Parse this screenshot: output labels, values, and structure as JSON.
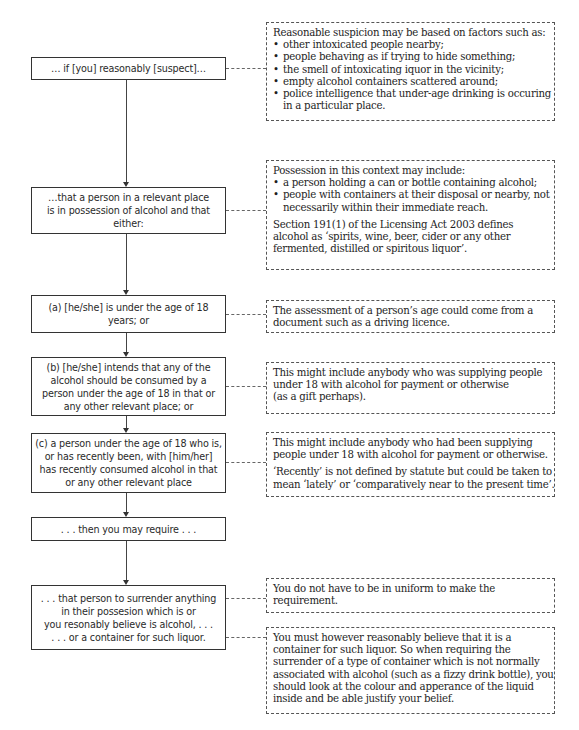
{
  "flowchart": {
    "steps": [
      {
        "lines": [
          "… if [you] reasonably [suspect]…"
        ]
      },
      {
        "lines": [
          "…that a person in a relevant place",
          "is in possession of alcohol and that",
          "either:"
        ]
      },
      {
        "lines": [
          "(a) [he/she] is under the age of 18",
          "years; or"
        ]
      },
      {
        "lines": [
          "(b) [he/she] intends that any of the",
          "alcohol should be consumed by a",
          "person under the age of 18 in that or",
          "any other relevant place; or"
        ]
      },
      {
        "lines": [
          "(c) a person under the age of 18 who is,",
          "or has recently been, with [him/her]",
          "has recently consumed alcohol in that",
          "or any other relevant place"
        ]
      },
      {
        "lines": [
          ". . . then you may require . . ."
        ]
      },
      {
        "lines": [
          ". . . that person to surrender anything",
          "in their possesion which is or",
          "you resonably believe is alcohol, . . .",
          ". . . or a container for such liquor."
        ]
      }
    ]
  },
  "notes": {
    "suspicion": {
      "intro": "Reasonable suspicion may be based on factors such as:",
      "bullets": [
        "other intoxicated people nearby;",
        "people behaving as if trying to hide something;",
        "the smell of intoxicating iquor in the vicinity;",
        "empty alcohol containers scattered around;",
        "police intelligence that under-age drinking is occuring"
      ],
      "bullet_continuation": "in a particular place."
    },
    "possession": {
      "intro": "Possession in this context may include:",
      "bullets": [
        "a person holding a can or bottle containing alcohol;",
        "people with containers at their disposal or nearby, not"
      ],
      "bullet_continuation": "necessarily within their immediate reach.",
      "definition_lines": [
        "Section 191(1) of the Licensing Act 2003 defines",
        "alcohol as ‘spirits, wine, beer, cider or any other",
        "fermented, distilled or spiritous liquor’."
      ]
    },
    "age": {
      "lines": [
        "The assessment of a person’s age could come from a",
        "document such as a driving licence."
      ]
    },
    "supplying_was": {
      "lines": [
        "This might include anybody who was supplying people",
        "under 18 with alcohol for payment or otherwise",
        "(as a gift perhaps)."
      ]
    },
    "supplying_had": {
      "lines": [
        "This might include anybody who had been supplying",
        "people under 18 with alcohol for payment or otherwise."
      ],
      "recently_lines": [
        "‘Recently’ is not defined by statute but could be taken to",
        "mean ‘lately’ or ‘comparatively near to the present time’."
      ]
    },
    "uniform": {
      "lines": [
        "You do not have to be in uniform to make the",
        "requirement."
      ]
    },
    "container": {
      "lines": [
        "You must however reasonably believe that it is a",
        "container for such liquor. So when requiring the",
        "surrender of a type of container which is not normally",
        "associated with alcohol (such as a fizzy drink bottle), you",
        "should look at the colour and apperance of the liquid",
        "inside and be able justify your belief."
      ]
    }
  }
}
